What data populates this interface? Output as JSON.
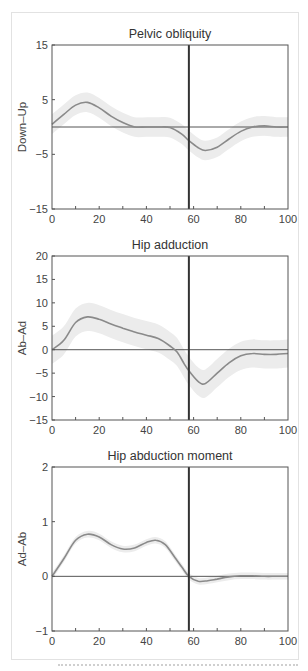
{
  "colors": {
    "frame": "#555555",
    "mean_line": "#8a8a8a",
    "sd_band": "#ececec",
    "zero_line": "#555555",
    "event_line": "#333333"
  },
  "chart_data": [
    {
      "type": "line",
      "title": "Pelvic obliquity",
      "xlabel": "",
      "ylabel": "Down–Up",
      "xlim": [
        0,
        100
      ],
      "ylim": [
        -15,
        15
      ],
      "x_ticks": [
        "0",
        "20",
        "40",
        "60",
        "80",
        "100"
      ],
      "y_ticks": [
        "15",
        "5",
        "-5",
        "-15"
      ],
      "y_tick_values": [
        15,
        5,
        -5,
        -15
      ],
      "event_line_x": 58,
      "grid": false,
      "series": [
        {
          "name": "mean",
          "x": [
            0,
            5,
            10,
            15,
            20,
            25,
            30,
            35,
            40,
            45,
            50,
            55,
            58,
            62,
            65,
            70,
            75,
            80,
            85,
            90,
            95,
            100
          ],
          "values": [
            0.5,
            2.3,
            4.0,
            4.5,
            3.5,
            2.0,
            0.8,
            0.0,
            0.0,
            0.0,
            -0.1,
            -1.3,
            -2.5,
            -3.8,
            -4.3,
            -3.7,
            -2.2,
            -0.8,
            0.0,
            0.2,
            0.0,
            0.0
          ],
          "sd": 1.8
        }
      ]
    },
    {
      "type": "line",
      "title": "Hip adduction",
      "xlabel": "",
      "ylabel": "Ab–Ad",
      "xlim": [
        0,
        100
      ],
      "ylim": [
        -15,
        20
      ],
      "x_ticks": [
        "0",
        "20",
        "40",
        "60",
        "80",
        "100"
      ],
      "y_ticks": [
        "20",
        "15",
        "10",
        "5",
        "0",
        "-5",
        "-10",
        "-15"
      ],
      "y_tick_values": [
        20,
        15,
        10,
        5,
        0,
        -5,
        -10,
        -15
      ],
      "event_line_x": 58,
      "grid": false,
      "series": [
        {
          "name": "mean",
          "x": [
            0,
            5,
            10,
            15,
            20,
            25,
            30,
            35,
            40,
            45,
            50,
            53,
            56,
            58,
            62,
            65,
            70,
            75,
            80,
            85,
            90,
            95,
            100
          ],
          "values": [
            0,
            2.0,
            5.8,
            7.0,
            6.5,
            5.5,
            4.6,
            3.8,
            3.1,
            2.4,
            0.8,
            -0.5,
            -3.0,
            -4.5,
            -6.8,
            -7.2,
            -5.0,
            -2.8,
            -1.3,
            -0.8,
            -1.0,
            -1.0,
            -0.8
          ],
          "sd": 3.0
        }
      ]
    },
    {
      "type": "line",
      "title": "Hip abduction moment",
      "xlabel": "",
      "ylabel": "Ad–Ab",
      "xlim": [
        0,
        100
      ],
      "ylim": [
        -1,
        2
      ],
      "x_ticks": [
        "0",
        "20",
        "40",
        "60",
        "80",
        "100"
      ],
      "y_ticks": [
        "2",
        "1",
        "0",
        "-1"
      ],
      "y_tick_values": [
        2,
        1,
        0,
        -1
      ],
      "event_line_x": 58,
      "grid": false,
      "series": [
        {
          "name": "mean",
          "x": [
            0,
            5,
            10,
            15,
            20,
            25,
            30,
            35,
            40,
            44,
            48,
            52,
            55,
            58,
            62,
            66,
            70,
            75,
            80,
            85,
            90,
            95,
            100
          ],
          "values": [
            0,
            0.32,
            0.66,
            0.77,
            0.72,
            0.58,
            0.5,
            0.52,
            0.62,
            0.66,
            0.58,
            0.35,
            0.17,
            0.0,
            -0.09,
            -0.08,
            -0.05,
            -0.01,
            0.01,
            0.01,
            0.0,
            0.0,
            0.0
          ],
          "sd": 0.06
        }
      ]
    }
  ]
}
